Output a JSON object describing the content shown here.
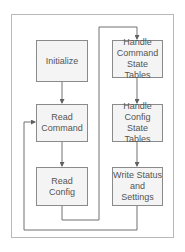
{
  "diagram": {
    "type": "flowchart",
    "nodes": [
      {
        "id": "initialize",
        "label": "Initialize"
      },
      {
        "id": "read_command",
        "label": "Read\nCommand"
      },
      {
        "id": "read_config",
        "label": "Read Config"
      },
      {
        "id": "handle_command",
        "label": "Handle\nCommand\nState Tables"
      },
      {
        "id": "handle_config",
        "label": "Handle\nConfig State\nTables"
      },
      {
        "id": "write_status",
        "label": "Write Status\nand Settings"
      }
    ],
    "edges": [
      {
        "from": "initialize",
        "to": "read_command"
      },
      {
        "from": "read_command",
        "to": "read_config"
      },
      {
        "from": "read_config",
        "to": "handle_command"
      },
      {
        "from": "handle_command",
        "to": "handle_config"
      },
      {
        "from": "handle_config",
        "to": "write_status"
      },
      {
        "from": "write_status",
        "to": "read_command"
      }
    ],
    "colors": {
      "line": "#707070",
      "box_border": "#8a8a8a",
      "box_fill": "#f4f4f4",
      "frame": "#b8b8b8",
      "text": "#555555"
    }
  }
}
